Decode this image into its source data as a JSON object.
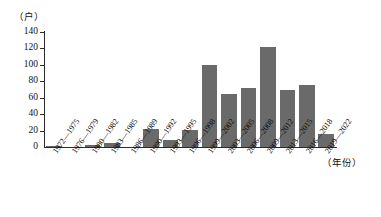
{
  "chart_data": {
    "type": "bar",
    "title": "",
    "subtitle": "",
    "xlabel": "（年份）",
    "ylabel": "（户）",
    "ylim": [
      0,
      140
    ],
    "ytick_step": 20,
    "yticks": [
      140,
      120,
      100,
      80,
      60,
      40,
      20,
      0
    ],
    "grid": false,
    "legend": null,
    "bar_color": "#6a6a6a",
    "axis_color": "#2b2b2b",
    "categories": [
      "1972—1975",
      "1976—1979",
      "1980—1982",
      "1983—1985",
      "1986—1989",
      "1990—1992",
      "1993—1995",
      "1996—1998",
      "1999—2002",
      "2003—2005",
      "2006—2008",
      "2009—2012",
      "2013—2015",
      "2016—2018",
      "2019—2022"
    ],
    "values": [
      1,
      0,
      3,
      5,
      0,
      22,
      9,
      21,
      100,
      64,
      72,
      122,
      70,
      76,
      16
    ],
    "series": [
      {
        "name": "户数",
        "values": [
          1,
          0,
          3,
          5,
          0,
          22,
          9,
          21,
          100,
          64,
          72,
          122,
          70,
          76,
          16
        ]
      }
    ]
  }
}
